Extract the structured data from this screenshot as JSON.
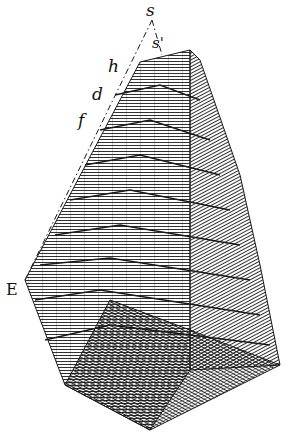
{
  "figure": {
    "labels": {
      "s": "s",
      "s_prime": "s'",
      "h": "h",
      "d": "d",
      "f": "f",
      "E": "E"
    },
    "ink_color": "#1a1a1a",
    "paper_color": "#ffffff",
    "step_count": 9
  }
}
